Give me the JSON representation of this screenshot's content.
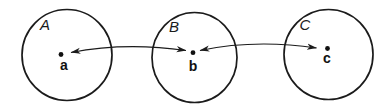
{
  "figure": {
    "type": "set-mapping-diagram",
    "colors": {
      "background": "#ffffff",
      "line": "#1b1b1b"
    },
    "circles": [
      {
        "label": "A",
        "point_label": "a"
      },
      {
        "label": "B",
        "point_label": "b"
      },
      {
        "label": "C",
        "point_label": "c"
      }
    ],
    "arrows": [
      {
        "from": "a",
        "to": "b",
        "double_headed": true
      },
      {
        "from": "b",
        "to": "c",
        "double_headed": true
      }
    ]
  }
}
